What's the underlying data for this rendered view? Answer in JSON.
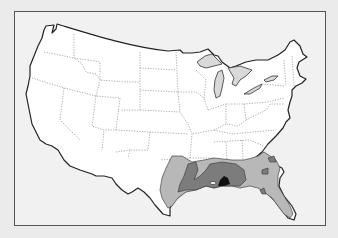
{
  "map": {
    "subject": "Contiguous United States range map",
    "colors": {
      "background": "#ebebeb",
      "frame_fill": "#f1f1f1",
      "frame_border": "#555555",
      "land": "#ffffff",
      "lakes": "#d9d9d9",
      "range_light": "#b8b8b8",
      "range_medium": "#7c7c7c",
      "range_dark": "#111111"
    },
    "legend": [],
    "range_zones": [
      {
        "level": "low",
        "region": "Southeastern US: east Texas, Louisiana, Mississippi, Alabama, Georgia, South Carolina, Florida"
      },
      {
        "level": "medium",
        "region": "Louisiana, Mississippi, southern Alabama"
      },
      {
        "level": "high",
        "region": "Gulf coast near Mississippi/Alabama"
      }
    ]
  }
}
